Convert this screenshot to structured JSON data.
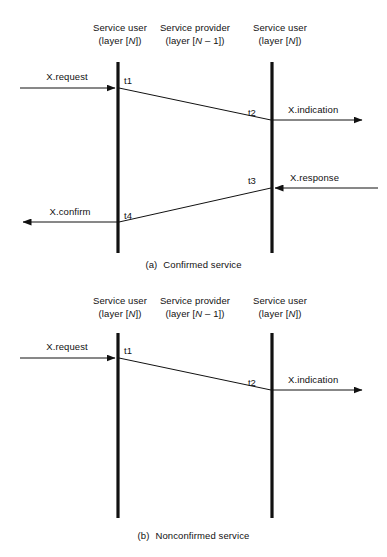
{
  "page": {
    "background_color": "#ffffff",
    "line_color": "#111111",
    "text_color": "#111111",
    "width": 387,
    "height": 557
  },
  "figures": [
    {
      "id": "a",
      "caption_index": "(a)",
      "caption_text": "Confirmed service",
      "headers": [
        {
          "line1": "Service user",
          "line2_pre": "(layer [",
          "line2_var": "N",
          "line2_post": "])"
        },
        {
          "line1": "Service provider",
          "line2_pre": "(layer [",
          "line2_var": "N",
          "line2_post": " – 1])"
        },
        {
          "line1": "Service user",
          "line2_pre": "(layer [",
          "line2_var": "N",
          "line2_post": "])"
        }
      ],
      "timeline_labels": [
        "t1",
        "t2",
        "t3",
        "t4"
      ],
      "messages": [
        {
          "label": "X.request",
          "direction": "right",
          "side": "left"
        },
        {
          "label": "X.indication",
          "direction": "right",
          "side": "right"
        },
        {
          "label": "X.response",
          "direction": "left",
          "side": "right"
        },
        {
          "label": "X.confirm",
          "direction": "left",
          "side": "left"
        }
      ]
    },
    {
      "id": "b",
      "caption_index": "(b)",
      "caption_text": "Nonconfirmed service",
      "headers": [
        {
          "line1": "Service user",
          "line2_pre": "(layer [",
          "line2_var": "N",
          "line2_post": "])"
        },
        {
          "line1": "Service provider",
          "line2_pre": "(layer [",
          "line2_var": "N",
          "line2_post": " – 1])"
        },
        {
          "line1": "Service user",
          "line2_pre": "(layer [",
          "line2_var": "N",
          "line2_post": "])"
        }
      ],
      "timeline_labels": [
        "t1",
        "t2"
      ],
      "messages": [
        {
          "label": "X.request",
          "direction": "right",
          "side": "left"
        },
        {
          "label": "X.indication",
          "direction": "right",
          "side": "right"
        }
      ]
    }
  ]
}
